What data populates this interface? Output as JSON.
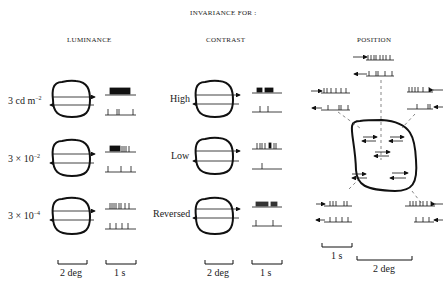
{
  "title": "INVARIANCE FOR :",
  "columns": {
    "luminance": {
      "heading": "LUMINANCE",
      "rows": [
        {
          "label": "3 cd m",
          "sup": "−2"
        },
        {
          "label": "3 × 10",
          "sup": "−2"
        },
        {
          "label": "3 × 10",
          "sup": "−4"
        }
      ],
      "scale_space": "2 deg",
      "scale_time": "1 s"
    },
    "contrast": {
      "heading": "CONTRAST",
      "rows": [
        {
          "label": "High"
        },
        {
          "label": "Low"
        },
        {
          "label": "Reversed"
        }
      ],
      "scale_space": "2 deg",
      "scale_time": "1 s"
    },
    "position": {
      "heading": "POSITION",
      "scale_time": "1 s",
      "scale_space": "2 deg"
    }
  },
  "icons": {
    "receptive_field": "rounded-outline-shape",
    "motion_arrow": "arrow",
    "spike_train": "vertical-tick-raster"
  },
  "colors": {
    "ink": "#111111",
    "background": "#ffffff",
    "dashed": "#555555"
  }
}
